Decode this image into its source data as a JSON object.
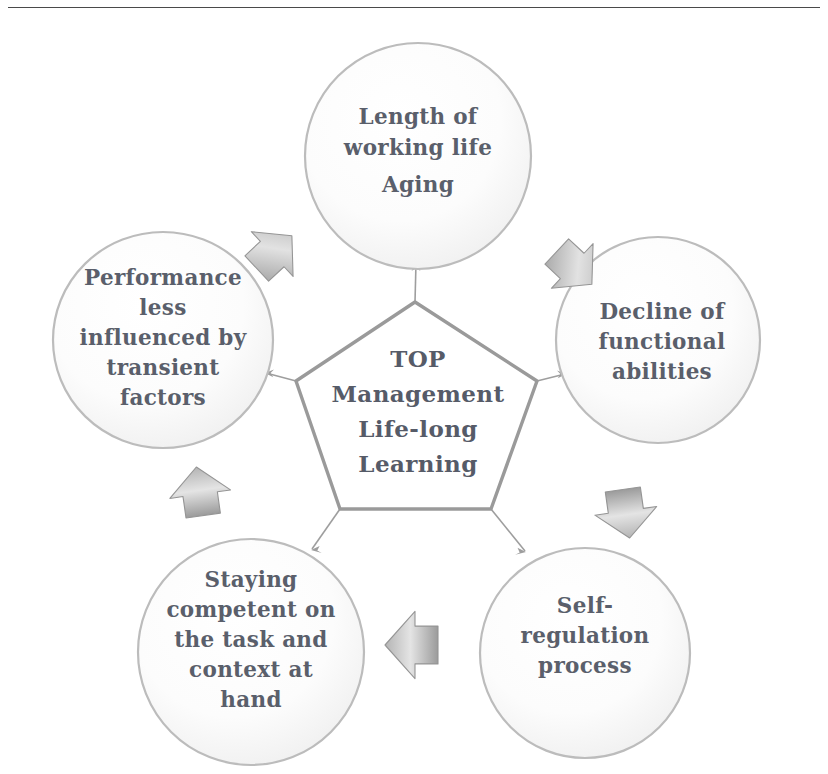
{
  "page": {
    "background_color": "#ffffff",
    "rule_color": "#4a4a4a"
  },
  "colors": {
    "text": "#5a5f6b",
    "center_text": "#565b68",
    "bubble_fill": "#fdfdfd",
    "bubble_stroke": "#b9b9b9",
    "pentagon_stroke": "#9a9a9a",
    "arrow_fill": "#a8a8a8",
    "arrow_stroke": "#8f8f8f",
    "connector": "#9e9e9e"
  },
  "center": {
    "name": "central-pentagon",
    "lines": [
      "TOP",
      "Management",
      "Life-long",
      "Learning"
    ]
  },
  "nodes": [
    {
      "id": "length-of-working-life",
      "position": "top",
      "lines": [
        "Length of",
        "working life",
        "Aging"
      ],
      "cx": 418,
      "cy": 156,
      "rx": 113,
      "ry": 113
    },
    {
      "id": "decline-of-functional-abilities",
      "position": "right",
      "lines": [
        "Decline of",
        "functional",
        "abilities"
      ],
      "cx": 658,
      "cy": 340,
      "rx": 102,
      "ry": 103
    },
    {
      "id": "self-regulation-process",
      "position": "bottom-right",
      "lines": [
        "Self-",
        "regulation",
        "process"
      ],
      "cx": 585,
      "cy": 653,
      "rx": 105,
      "ry": 105
    },
    {
      "id": "staying-competent",
      "position": "bottom-left",
      "lines": [
        "Staying",
        "competent on",
        "the task and",
        "context at",
        "hand"
      ],
      "cx": 251,
      "cy": 652,
      "rx": 113,
      "ry": 113
    },
    {
      "id": "performance-less-influenced",
      "position": "left",
      "lines": [
        "Performance",
        "less",
        "influenced by",
        "transient",
        "factors"
      ],
      "cx": 163,
      "cy": 340,
      "rx": 110,
      "ry": 108
    }
  ],
  "arrows": [
    {
      "id": "arrow-left-to-top",
      "direction": "up-right",
      "from": "performance-less-influenced",
      "to": "length-of-working-life"
    },
    {
      "id": "arrow-top-to-right",
      "direction": "down-right",
      "from": "length-of-working-life",
      "to": "decline-of-functional-abilities"
    },
    {
      "id": "arrow-right-to-bottom-right",
      "direction": "down",
      "from": "decline-of-functional-abilities",
      "to": "self-regulation-process"
    },
    {
      "id": "arrow-bottom-right-to-bottom-left",
      "direction": "left",
      "from": "self-regulation-process",
      "to": "staying-competent"
    },
    {
      "id": "arrow-bottom-left-to-left",
      "direction": "up",
      "from": "staying-competent",
      "to": "performance-less-influenced"
    }
  ],
  "connectors": [
    {
      "id": "connector-center-to-top",
      "from": "central-pentagon",
      "to": "length-of-working-life"
    },
    {
      "id": "connector-center-to-right",
      "from": "central-pentagon",
      "to": "decline-of-functional-abilities"
    },
    {
      "id": "connector-center-to-bottom-right",
      "from": "central-pentagon",
      "to": "self-regulation-process"
    },
    {
      "id": "connector-center-to-bottom-left",
      "from": "central-pentagon",
      "to": "staying-competent"
    },
    {
      "id": "connector-center-to-left",
      "from": "central-pentagon",
      "to": "performance-less-influenced"
    }
  ]
}
